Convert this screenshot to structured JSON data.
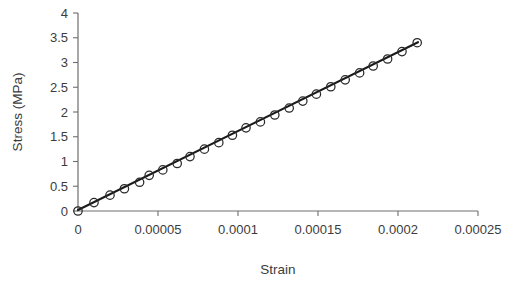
{
  "chart_data": {
    "type": "scatter",
    "title": "",
    "xlabel": "Strain",
    "ylabel": "Stress (MPa)",
    "xlim": [
      0,
      0.00025
    ],
    "ylim": [
      0,
      4
    ],
    "grid": false,
    "legend": null,
    "xticks": [
      0,
      5e-05,
      0.0001,
      0.00015,
      0.0002,
      0.00025
    ],
    "xtick_labels": [
      "0",
      "0.00005",
      "0.0001",
      "0.00015",
      "0.0002",
      "0.00025"
    ],
    "yticks": [
      0,
      0.5,
      1,
      1.5,
      2,
      2.5,
      3,
      3.5,
      4
    ],
    "ytick_labels": [
      "0",
      "0.5",
      "1",
      "1.5",
      "2",
      "2.5",
      "3",
      "3.5",
      "4"
    ],
    "series": [
      {
        "name": "Measured data",
        "marker": "open-circle",
        "marker_color": "#2a2a2a",
        "x": [
          0.0,
          1e-05,
          2e-05,
          2.9e-05,
          3.85e-05,
          4.45e-05,
          5.3e-05,
          6.2e-05,
          7e-05,
          7.9e-05,
          8.8e-05,
          9.65e-05,
          0.000105,
          0.000114,
          0.000123,
          0.000132,
          0.0001405,
          0.000149,
          0.000158,
          0.000167,
          0.000176,
          0.0001845,
          0.0001935,
          0.0002025,
          0.000212
        ],
        "y": [
          0.0,
          0.17,
          0.32,
          0.45,
          0.58,
          0.72,
          0.83,
          0.96,
          1.1,
          1.25,
          1.38,
          1.53,
          1.68,
          1.8,
          1.94,
          2.08,
          2.22,
          2.36,
          2.51,
          2.65,
          2.79,
          2.93,
          3.07,
          3.22,
          3.4
        ]
      },
      {
        "name": "Linear fit",
        "type": "line",
        "color": "#1a1a1a",
        "x": [
          0.0,
          0.0002125
        ],
        "y": [
          0.02,
          3.41
        ],
        "slope_mpa": 15950
      }
    ]
  },
  "axes": {
    "x_title": "Strain",
    "y_title": "Stress (MPa)"
  }
}
